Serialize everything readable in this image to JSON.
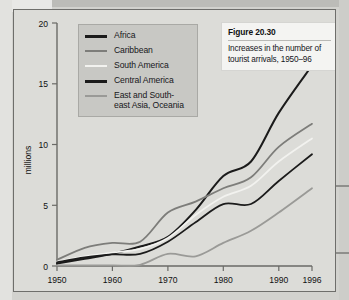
{
  "figure": {
    "caption_title": "Figure 20.30",
    "caption_body": "Increases in the number of tourist arrivals, 1950–96"
  },
  "legend": {
    "items": [
      {
        "label": "Africa",
        "color": "#1b1b1b"
      },
      {
        "label": "Caribbean",
        "color": "#7d7d7a"
      },
      {
        "label": "South America",
        "color": "#f2f2ef"
      },
      {
        "label": "Central America",
        "color": "#1b1b1b"
      },
      {
        "label": "East and South-\neast Asia, Oceania",
        "color": "#9a9a97"
      }
    ]
  },
  "chart_data": {
    "type": "line",
    "title": "Figure 20.30",
    "subtitle": "Increases in the number of tourist arrivals, 1950–96",
    "xlabel": "",
    "ylabel": "millions",
    "xlim": [
      1950,
      1996
    ],
    "ylim": [
      0,
      20
    ],
    "yticks": [
      0,
      5,
      10,
      15,
      20
    ],
    "xticks": [
      1950,
      1960,
      1970,
      1980,
      1990,
      1996
    ],
    "xtick_labels": [
      "1950",
      "1960",
      "1970",
      "1980",
      "1990",
      "1996"
    ],
    "ytick_labels": [
      "0",
      "5",
      "10",
      "15",
      "20"
    ],
    "grid": false,
    "legend_position": "upper-left",
    "x": [
      1950,
      1955,
      1960,
      1965,
      1970,
      1975,
      1980,
      1985,
      1990,
      1996
    ],
    "series": [
      {
        "name": "East and South-east Asia, Oceania",
        "color": "#1b1b1b",
        "width": 2.0,
        "values": [
          0.2,
          0.6,
          1.0,
          1.6,
          2.4,
          4.6,
          7.4,
          8.6,
          12.6,
          16.5
        ]
      },
      {
        "name": "Caribbean",
        "color": "#7d7d7a",
        "width": 1.8,
        "values": [
          0.5,
          1.5,
          1.9,
          2.0,
          4.4,
          5.3,
          6.4,
          7.3,
          9.8,
          11.7
        ]
      },
      {
        "name": "South America",
        "color": "#f2f2ef",
        "width": 1.8,
        "values": [
          0.35,
          0.8,
          1.1,
          1.4,
          2.3,
          4.2,
          5.7,
          6.6,
          8.6,
          10.5
        ]
      },
      {
        "name": "Africa",
        "color": "#1b1b1b",
        "width": 1.8,
        "values": [
          0.3,
          0.7,
          0.95,
          1.0,
          2.0,
          3.6,
          5.1,
          5.1,
          7.0,
          9.2
        ]
      },
      {
        "name": "Central America",
        "color": "#9a9a97",
        "width": 1.8,
        "values": [
          0.05,
          0.05,
          0.05,
          0.1,
          1.0,
          0.8,
          1.9,
          2.9,
          4.4,
          6.4
        ]
      }
    ]
  }
}
